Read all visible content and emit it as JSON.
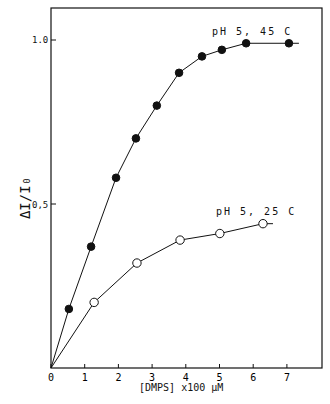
{
  "chart_data": {
    "type": "line",
    "title": "",
    "xlabel": "[DMPS] x100 μM",
    "ylabel": "ΔI/I0",
    "xlim": [
      0,
      8
    ],
    "ylim": [
      0,
      1.15
    ],
    "xticks": [
      "0",
      "1",
      "2",
      "3",
      "4",
      "5",
      "6",
      "7"
    ],
    "yticks": [
      "0.5",
      "1.0"
    ],
    "grid": false,
    "series": [
      {
        "name": "pH 5, 45 C",
        "marker": "filled-circle",
        "x": [
          0,
          0.53,
          1.19,
          1.93,
          2.52,
          3.14,
          3.8,
          4.48,
          5.07,
          5.79,
          7.06
        ],
        "y": [
          0,
          0.18,
          0.37,
          0.58,
          0.7,
          0.8,
          0.9,
          0.95,
          0.97,
          0.99,
          0.99
        ]
      },
      {
        "name": "pH 5, 25 C",
        "marker": "open-circle",
        "x": [
          0,
          1.28,
          2.55,
          3.83,
          5.01,
          6.29
        ],
        "y": [
          0,
          0.2,
          0.32,
          0.39,
          0.41,
          0.44
        ]
      }
    ]
  },
  "labels": {
    "s1": "pH 5, 45 C",
    "s2": "pH 5, 25 C",
    "xlabel": "[DMPS]  x100 μM",
    "y10": "1.0",
    "y05": "0,5"
  }
}
